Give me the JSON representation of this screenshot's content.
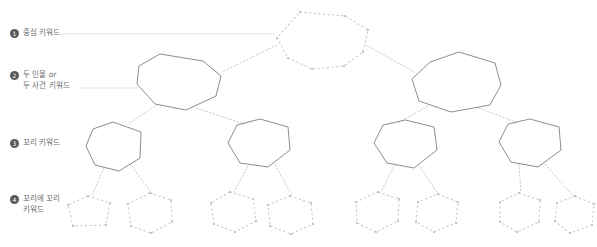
{
  "diagram": {
    "background_color": "#ffffff",
    "solid_stroke_color": "#808080",
    "dashed_stroke_color": "#c9c9d6",
    "connector_color": "#c9c9d6",
    "leader_color": "#d8d8d8",
    "bullet_color": "#595959",
    "label_text_color": "#6b6b6b"
  },
  "legend": {
    "items": [
      {
        "number": "1",
        "label": "중심 키워드",
        "leader_to_x": 272,
        "leader_y": 33
      },
      {
        "number": "2",
        "label": "두 인물 or\n두 사건 키워드",
        "leader_to_x": 136,
        "leader_y": 87
      },
      {
        "number": "3",
        "label": "꼬리 키워드",
        "leader_to_x": 0,
        "leader_y": 0
      },
      {
        "number": "4",
        "label": "꼬리에 꼬리\n키워드",
        "leader_to_x": 0,
        "leader_y": 0
      }
    ]
  },
  "nodes": {
    "level1": [
      {
        "id": "root",
        "style": "dashed",
        "points": "300,12 345,16 368,30 363,52 344,66 312,69 288,58 277,38"
      }
    ],
    "level2": [
      {
        "id": "branch-left",
        "style": "solid",
        "points": "160,54 203,61 221,76 216,96 186,110 155,104 137,84 139,66"
      },
      {
        "id": "branch-right",
        "style": "solid",
        "points": "459,52 495,63 501,85 490,105 451,112 419,101 412,79 430,62"
      }
    ],
    "level3": [
      {
        "id": "tail-1",
        "style": "solid",
        "points": "113,122 141,132 140,158 119,171 95,165 86,146 93,129"
      },
      {
        "id": "tail-2",
        "style": "solid",
        "points": "260,119 288,127 290,150 268,167 240,163 228,143 237,125"
      },
      {
        "id": "tail-3",
        "style": "solid",
        "points": "405,120 434,127 437,150 414,168 387,163 374,143 383,125"
      },
      {
        "id": "tail-4",
        "style": "solid",
        "points": "530,119 559,127 561,150 538,167 511,162 499,142 508,124"
      }
    ],
    "level4": [
      {
        "id": "leaf-1",
        "style": "dashed",
        "points": "88,196 110,203 106,225 73,226 68,205"
      },
      {
        "id": "leaf-2",
        "style": "dashed",
        "points": "150,193 171,200 172,222 151,233 131,226 128,204"
      },
      {
        "id": "leaf-3",
        "style": "dashed",
        "points": "230,192 253,199 256,221 235,232 214,224 211,203"
      },
      {
        "id": "leaf-4",
        "style": "dashed",
        "points": "290,196 311,203 313,224 291,234 270,226 268,205"
      },
      {
        "id": "leaf-5",
        "style": "dashed",
        "points": "378,192 399,199 398,221 376,232 357,223 356,202"
      },
      {
        "id": "leaf-6",
        "style": "dashed",
        "points": "438,194 458,202 456,223 434,232 416,222 418,202"
      },
      {
        "id": "leaf-7",
        "style": "dashed",
        "points": "519,193 540,200 539,222 517,232 500,222 500,202"
      },
      {
        "id": "leaf-8",
        "style": "dashed",
        "points": "575,196 594,204 592,225 570,233 555,221 557,203"
      }
    ]
  },
  "connectors": [
    {
      "from": "root",
      "to": "branch-left",
      "x1": 277,
      "y1": 45,
      "x2": 222,
      "y2": 72
    },
    {
      "from": "root",
      "to": "branch-right",
      "x1": 366,
      "y1": 45,
      "x2": 414,
      "y2": 72
    },
    {
      "from": "branch-left",
      "to": "tail-1",
      "x1": 155,
      "y1": 106,
      "x2": 128,
      "y2": 124
    },
    {
      "from": "branch-left",
      "to": "tail-2",
      "x1": 196,
      "y1": 108,
      "x2": 244,
      "y2": 124
    },
    {
      "from": "branch-right",
      "to": "tail-3",
      "x1": 428,
      "y1": 106,
      "x2": 398,
      "y2": 123
    },
    {
      "from": "branch-right",
      "to": "tail-4",
      "x1": 479,
      "y1": 108,
      "x2": 518,
      "y2": 123
    },
    {
      "from": "tail-1",
      "to": "leaf-1",
      "x1": 104,
      "y1": 168,
      "x2": 92,
      "y2": 195
    },
    {
      "from": "tail-1",
      "to": "leaf-2",
      "x1": 130,
      "y1": 164,
      "x2": 152,
      "y2": 193
    },
    {
      "from": "tail-2",
      "to": "leaf-3",
      "x1": 248,
      "y1": 166,
      "x2": 234,
      "y2": 192
    },
    {
      "from": "tail-2",
      "to": "leaf-4",
      "x1": 275,
      "y1": 165,
      "x2": 292,
      "y2": 195
    },
    {
      "from": "tail-3",
      "to": "leaf-5",
      "x1": 394,
      "y1": 166,
      "x2": 381,
      "y2": 192
    },
    {
      "from": "tail-3",
      "to": "leaf-6",
      "x1": 420,
      "y1": 167,
      "x2": 438,
      "y2": 194
    },
    {
      "from": "tail-4",
      "to": "leaf-7",
      "x1": 519,
      "y1": 164,
      "x2": 521,
      "y2": 192
    },
    {
      "from": "tail-4",
      "to": "leaf-8",
      "x1": 545,
      "y1": 164,
      "x2": 573,
      "y2": 196
    }
  ],
  "leaders": [
    {
      "x1": 60,
      "y1": 34,
      "x2": 274,
      "y2": 34
    },
    {
      "x1": 80,
      "y1": 88,
      "x2": 138,
      "y2": 88
    }
  ]
}
